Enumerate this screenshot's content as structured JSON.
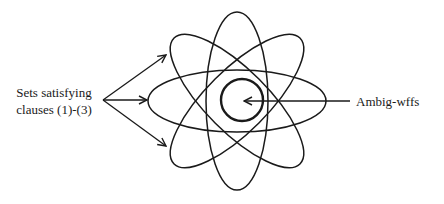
{
  "diagram": {
    "labels": {
      "sets": [
        "Sets satisfying",
        "clauses (1)-(3)"
      ],
      "center": "Ambig-wffs"
    },
    "ellipses": {
      "count": 4,
      "center": [
        237,
        101
      ],
      "rx": 89,
      "ry": 31,
      "rotations_deg": [
        0,
        45,
        90,
        135
      ]
    },
    "inner_circle": {
      "center": [
        242,
        100
      ],
      "r": 21
    },
    "stroke_color": "#1a1a1a"
  }
}
